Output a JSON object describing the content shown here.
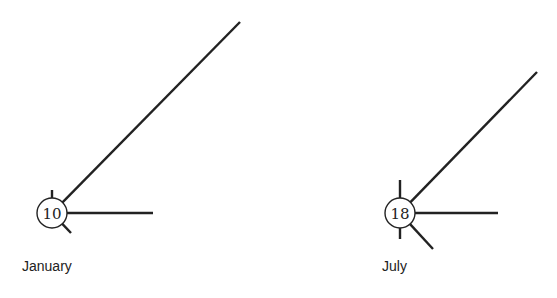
{
  "diagram": {
    "type": "station-model wind rose comparison",
    "colors": {
      "stroke": "#222222",
      "background": "#ffffff"
    },
    "panels": [
      {
        "label": "January",
        "center_value": "10",
        "center": [
          52,
          213
        ],
        "radius": 15,
        "label_pos": [
          22,
          268
        ],
        "rays": [
          {
            "direction": "NE",
            "x2": 240,
            "y2": 22,
            "length": "long"
          },
          {
            "direction": "E",
            "x2": 153,
            "y2": 213,
            "length": "medium"
          },
          {
            "direction": "N",
            "x2": 52,
            "y2": 190,
            "length": "short"
          },
          {
            "direction": "SE",
            "x2": 71,
            "y2": 233,
            "length": "short"
          }
        ]
      },
      {
        "label": "July",
        "center_value": "18",
        "center": [
          400,
          213
        ],
        "radius": 15,
        "label_pos": [
          382,
          268
        ],
        "rays": [
          {
            "direction": "NE",
            "x2": 537,
            "y2": 72,
            "length": "long"
          },
          {
            "direction": "E",
            "x2": 498,
            "y2": 213,
            "length": "medium"
          },
          {
            "direction": "N",
            "x2": 400,
            "y2": 180,
            "length": "short"
          },
          {
            "direction": "S",
            "x2": 400,
            "y2": 239,
            "length": "short"
          },
          {
            "direction": "SE",
            "x2": 433,
            "y2": 249,
            "length": "short"
          }
        ]
      }
    ]
  }
}
